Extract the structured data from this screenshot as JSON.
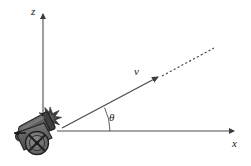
{
  "figure": {
    "background_color": "#ffffff",
    "width": 251,
    "height": 166
  },
  "axes": {
    "vertical": {
      "label": "z",
      "name": "z-axis",
      "color": "#4d4d4d",
      "origin_x": 43,
      "top_y": 12,
      "bottom_y": 131,
      "label_x": 31,
      "label_y": 13,
      "arrow": "up"
    },
    "horizontal": {
      "label": "x",
      "name": "x-axis",
      "color": "#4d4d4d",
      "origin_y": 131,
      "start_x": 57,
      "end_x": 237,
      "label_x": 234,
      "label_y": 146,
      "arrow": "right"
    }
  },
  "velocity": {
    "label": "v",
    "label_x": 137,
    "label_y": 73,
    "color": "#4d4d4d",
    "solid_start_x": 62,
    "solid_start_y": 128,
    "solid_end_x": 160,
    "solid_end_y": 77,
    "dashed_end_x": 214,
    "dashed_end_y": 48,
    "arrow_tip_x": 160,
    "arrow_tip_y": 77,
    "dash_pattern": "2 2"
  },
  "angle": {
    "label": "θ",
    "label_x": 113,
    "label_y": 118,
    "arc_radius": 54,
    "arc_center_x": 57,
    "arc_center_y": 131,
    "color": "#4d4d4d",
    "degrees_text": ""
  },
  "cannon": {
    "name": "cannon",
    "body_color": "#5c5c5c",
    "barrel_color": "#4a4a4a",
    "wheel_color": "#6b6b6b",
    "outline_color": "#2b2b2b",
    "flash_color": "#3a3a3a",
    "recoil_arrow_color": "#1a1a1a",
    "barrel_angle_deg": 28
  }
}
